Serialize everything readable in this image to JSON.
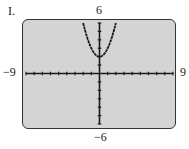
{
  "figure_label": "I.",
  "window": {
    "xmin": -9,
    "xmax": 9,
    "ymin": -6,
    "ymax": 6,
    "xscl": 1,
    "yscl": 1
  },
  "axis_labels": {
    "xmin": "-9",
    "xmax": "9",
    "ymin": "-6",
    "ymax": "6"
  },
  "colors": {
    "screen": "#d4d4d4",
    "curve": "#1a1a1a"
  },
  "chart_data": {
    "type": "line",
    "title": "I.",
    "xlabel": "",
    "ylabel": "",
    "xlim": [
      -9,
      9
    ],
    "ylim": [
      -6,
      6
    ],
    "grid": false,
    "tick_labels": {
      "x": [
        "-9",
        "9"
      ],
      "y": [
        "-6",
        "6"
      ]
    },
    "series": [
      {
        "name": "y = x^2 + 2",
        "x": [
          -2,
          -1.5,
          -1,
          -0.5,
          0,
          0.5,
          1,
          1.5,
          2
        ],
        "y": [
          6,
          4.25,
          3,
          2.25,
          2,
          2.25,
          3,
          4.25,
          6
        ]
      }
    ]
  }
}
